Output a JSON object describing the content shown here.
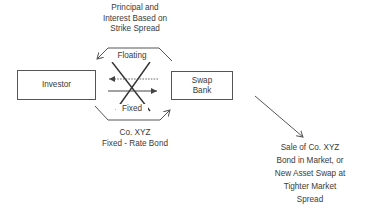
{
  "diagram": {
    "type": "asset swap flow diagram",
    "nodes": {
      "investor": {
        "label": "Investor"
      },
      "swap_bank": {
        "label_line1": "Swap",
        "label_line2": "Bank"
      }
    },
    "labels": {
      "top": {
        "line1": "Principal and",
        "line2": "Interest Based on",
        "line3": "Strike Spread"
      },
      "floating": "Floating",
      "fixed": "Fixed",
      "bottom": {
        "line1": "Co. XYZ",
        "line2": "Fixed - Rate Bond"
      },
      "outcome": {
        "line1": "Sale of Co. XYZ",
        "line2": "Bond in Market, or",
        "line3": "New Asset Swap at",
        "line4": "Tighter Market",
        "line5": "Spread"
      }
    },
    "edges": [
      {
        "from": "swap_bank",
        "to": "investor",
        "label": "Principal and Interest Based on Strike Spread",
        "path": "top-arc"
      },
      {
        "from": "investor",
        "to": "swap_bank",
        "label": "Co. XYZ Fixed-Rate Bond",
        "path": "bottom-arc"
      },
      {
        "from": "swap_bank",
        "to": "investor",
        "label": "Floating",
        "style": "dotted"
      },
      {
        "from": "investor",
        "to": "swap_bank",
        "label": "Fixed",
        "style": "solid"
      },
      {
        "from": "swap_bank",
        "to": "outcome",
        "label": "Sale of Co. XYZ Bond in Market, or New Asset Swap at Tighter Market Spread",
        "style": "diagonal"
      }
    ],
    "colors": {
      "line": "#555555",
      "text": "#3a3a3a",
      "background": "#ffffff"
    }
  }
}
